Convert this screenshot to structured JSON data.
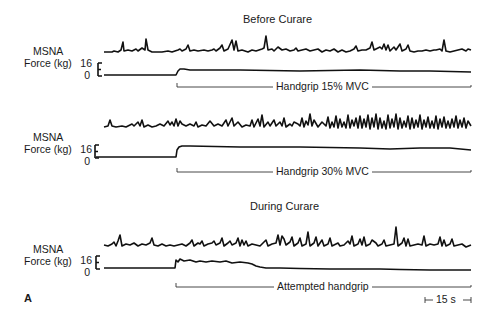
{
  "figure": {
    "panel_letter": "A",
    "sections": [
      {
        "title": "Before Curare"
      },
      {
        "title": "During Curare"
      }
    ],
    "rows": [
      {
        "msna_label": "MSNA",
        "force_label": "Force (kg)",
        "force_tick_top": "16",
        "force_tick_bottom": "0",
        "bracket_label": "Handgrip 15% MVC"
      },
      {
        "msna_label": "MSNA",
        "force_label": "Force (kg)",
        "force_tick_top": "16",
        "force_tick_bottom": "0",
        "bracket_label": "Handgrip 30% MVC"
      },
      {
        "msna_label": "MSNA",
        "force_label": "Force (kg)",
        "force_tick_top": "16",
        "force_tick_bottom": "0",
        "bracket_label": "Attempted handgrip"
      }
    ],
    "scale_bar": {
      "label": "15 s"
    },
    "colors": {
      "trace": "#111111",
      "bracket": "#333333",
      "background": "#ffffff"
    }
  }
}
